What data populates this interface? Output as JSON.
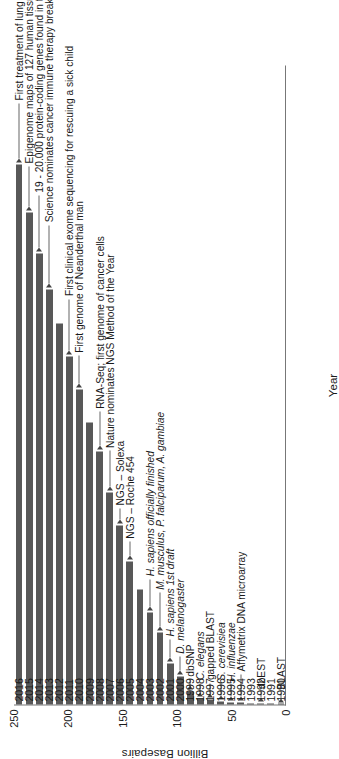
{
  "chart_data": {
    "type": "bar",
    "orientation": "horizontal",
    "title": "",
    "xlabel": "Year",
    "ylabel": "Billion Basepairs",
    "ylim": [
      0,
      250
    ],
    "yticks": [
      0,
      50,
      100,
      150,
      200,
      250
    ],
    "grid": false,
    "legend": null,
    "bar_color": "#585858",
    "axis_color": "#777777",
    "categories": [
      "1990",
      "1991",
      "1992",
      "1993",
      "1994",
      "1995",
      "1996",
      "1997",
      "1998",
      "1999",
      "2000",
      "2001",
      "2002",
      "2003",
      "2004",
      "2005",
      "2006",
      "2007",
      "2008",
      "2009",
      "2010",
      "2011",
      "2012",
      "2013",
      "2014",
      "2015",
      "2016"
    ],
    "values": [
      0.05,
      0.1,
      0.2,
      0.4,
      0.6,
      0.8,
      1.2,
      1.8,
      2.5,
      5,
      11,
      16,
      28,
      36,
      45,
      56,
      70,
      83,
      99,
      110,
      123,
      136,
      149,
      162,
      176,
      192,
      211
    ],
    "annotations": [
      {
        "year": "1990",
        "label": "BLAST"
      },
      {
        "year": "1992",
        "label": "dbEST"
      },
      {
        "year": "1994",
        "label": "Affymetrix DNA microarray"
      },
      {
        "year": "1995",
        "label": "H. influenzae",
        "italic": true
      },
      {
        "year": "1996",
        "label": "S. cerevisiea",
        "italic": true
      },
      {
        "year": "1997",
        "label": "gapped BLAST"
      },
      {
        "year": "1998",
        "label": "C. elegans",
        "italic": true
      },
      {
        "year": "1999",
        "label": "dbSNP"
      },
      {
        "year": "2000",
        "label": "D. melanogaster",
        "italic": true
      },
      {
        "year": "2001",
        "label": "H. sapiens 1st draft",
        "italic": true
      },
      {
        "year": "2002",
        "label": "M. musculus, P. falciparum, A. gambiae",
        "italic": true
      },
      {
        "year": "2003",
        "label": "H. sapiens officially finished",
        "italic": true
      },
      {
        "year": "2005",
        "label": "NGS – Roche 454"
      },
      {
        "year": "2006",
        "label": "NGS – Solexa"
      },
      {
        "year": "2007",
        "label": "Nature nominates NGS Method of the Year"
      },
      {
        "year": "2008",
        "label": "RNA-Seq; first genome of cancer cells"
      },
      {
        "year": "2010",
        "label": "First genome of Neanderthal man"
      },
      {
        "year": "2011",
        "label": "First clinical exome sequencing for rescuing a sick child"
      },
      {
        "year": "2013",
        "label": "Science nominates cancer immune therapy break through of the year"
      },
      {
        "year": "2014",
        "label": "19 - 20.000 protein-coding genes found in the human genome"
      },
      {
        "year": "2015",
        "label": "Epigenome maps of 127 human tissues and cells"
      },
      {
        "year": "2016",
        "label": "First treatment of lung cancer with CRISPR–Cas9 gene scissors"
      }
    ]
  }
}
